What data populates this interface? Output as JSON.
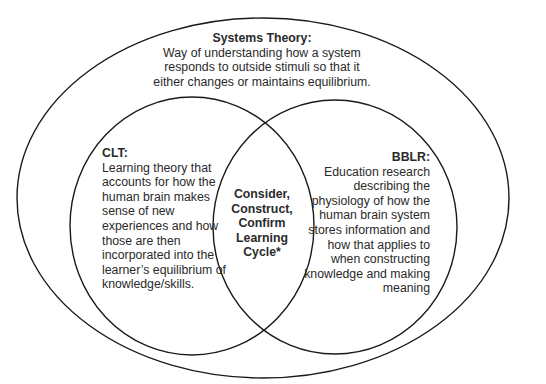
{
  "diagram": {
    "type": "venn",
    "stroke_color": "#1a1a1a",
    "background": "#ffffff",
    "outer": {
      "title": "Systems Theory:",
      "lines": [
        "Way of understanding how a system",
        "responds to outside stimuli so that it",
        "either changes or maintains equilibrium."
      ]
    },
    "left": {
      "title": "CLT:",
      "lines": [
        "Learning theory that",
        "accounts for how the",
        "human brain makes",
        "sense of new",
        "experiences and how",
        "those are then",
        "incorporated into the",
        "learner’s equilibrium of",
        "knowledge/skills."
      ]
    },
    "right": {
      "title": "BBLR:",
      "lines": [
        "Education research",
        "describing the",
        "physiology of how the",
        "human brain system",
        "stores information and",
        "how that applies to",
        "when constructing",
        "knowledge and making",
        "meaning"
      ]
    },
    "intersection": {
      "lines": [
        "Consider,",
        "Construct,",
        "Confirm",
        "Learning",
        "Cycle*"
      ]
    }
  }
}
